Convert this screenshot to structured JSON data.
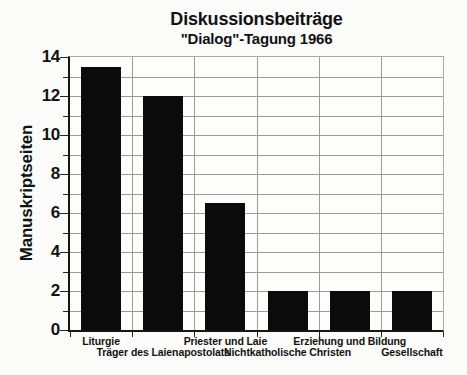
{
  "chart_data": {
    "type": "bar",
    "title": "Diskussionsbeiträge",
    "subtitle": "\"Dialog\"-Tagung 1966",
    "ylabel": "Manuskriptseiten",
    "xlabel": "",
    "categories": [
      "Liturgie",
      "Träger des Laienapostolats",
      "Priester und Laie",
      "Nichtkatholische Christen",
      "Erziehung und Bildung",
      "Gesellschaft"
    ],
    "values": [
      13.5,
      12,
      6.5,
      2,
      2,
      2
    ],
    "ylim": [
      0,
      14
    ],
    "yticks": [
      0,
      2,
      4,
      6,
      8,
      10,
      12,
      14
    ],
    "ytick_step": 2,
    "grid_step": 1,
    "grid_on": true,
    "legend": "none",
    "label_rows": [
      [
        0,
        2,
        4
      ],
      [
        1,
        3,
        5
      ]
    ],
    "bar_color": "#0b0b0b",
    "grid_color": "#9c9c9c",
    "axis_color": "#161616",
    "background_color": "#fbfbfa",
    "text_color": "#121212"
  }
}
